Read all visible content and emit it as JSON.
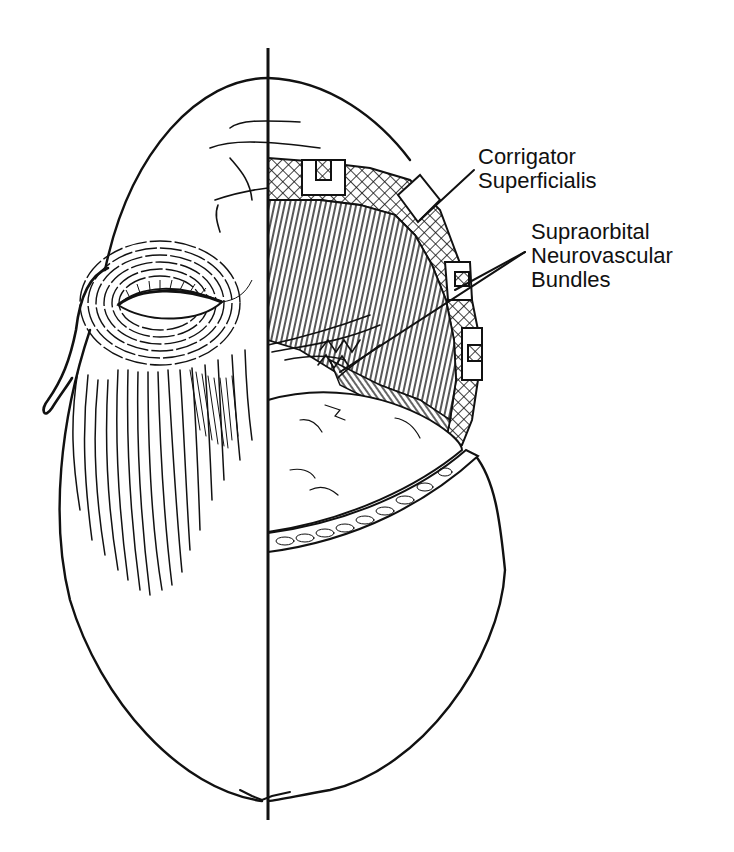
{
  "figure": {
    "ink_color": "#111111",
    "background_color": "#ffffff"
  },
  "labels": {
    "corrigator": {
      "line1": "Corrigator",
      "line2": "Superficialis"
    },
    "supraorbital": {
      "line1": "Supraorbital",
      "line2": "Neurovascular",
      "line3": "Bundles"
    }
  }
}
